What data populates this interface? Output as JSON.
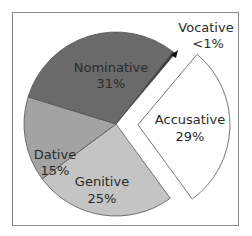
{
  "chart_data": {
    "type": "pie",
    "title": "",
    "start_angle_deg": 40,
    "direction": "clockwise",
    "exploded": "Accusative",
    "legend": "none",
    "slices": [
      {
        "label": "Accusative",
        "value": 29,
        "display": "29%",
        "color": "#ffffff"
      },
      {
        "label": "Genitive",
        "value": 25,
        "display": "25%",
        "color": "#c4c4c4"
      },
      {
        "label": "Dative",
        "value": 15,
        "display": "15%",
        "color": "#a3a3a3"
      },
      {
        "label": "Nominative",
        "value": 31,
        "display": "31%",
        "color": "#6a6a6a"
      },
      {
        "label": "Vocative",
        "value": 0.5,
        "display": "<1%",
        "color": "#3a3a3a"
      }
    ]
  },
  "labels": {
    "nominative": {
      "name": "Nominative",
      "pct": "31%"
    },
    "dative": {
      "name": "Dative",
      "pct": "15%"
    },
    "genitive": {
      "name": "Genitive",
      "pct": "25%"
    },
    "accusative": {
      "name": "Accusative",
      "pct": "29%"
    },
    "vocative": {
      "name": "Vocative",
      "pct": "<1%"
    }
  }
}
